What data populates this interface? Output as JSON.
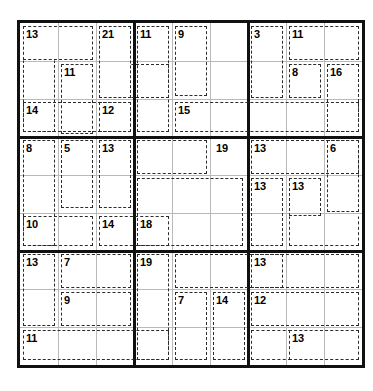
{
  "puzzle": {
    "type": "killer-sudoku",
    "grid_size": 9,
    "box_size": 3,
    "cell_px": 38,
    "colors": {
      "background": "#ffffff",
      "outer_border": "#111111",
      "box_border": "#111111",
      "cell_line": "#b9b9b9",
      "cage_dash": "#2b2b2b",
      "sum_text": "#000000"
    },
    "given_digits": [],
    "cages": [
      {
        "id": "c01",
        "sum": "13",
        "anchor_row": 0,
        "anchor_col": 0,
        "cells": [
          [
            0,
            0
          ],
          [
            0,
            1
          ],
          [
            1,
            0
          ],
          [
            2,
            0
          ]
        ]
      },
      {
        "id": "c02",
        "sum": "21",
        "anchor_row": 0,
        "anchor_col": 2,
        "cells": [
          [
            0,
            2
          ],
          [
            1,
            2
          ],
          [
            1,
            3
          ]
        ]
      },
      {
        "id": "c03",
        "sum": "11",
        "anchor_row": 1,
        "anchor_col": 1,
        "cells": [
          [
            1,
            1
          ],
          [
            2,
            1
          ]
        ]
      },
      {
        "id": "c04",
        "sum": "14",
        "anchor_row": 2,
        "anchor_col": 0,
        "cells": [
          [
            2,
            0
          ],
          [
            2,
            1
          ],
          [
            2,
            2
          ]
        ]
      },
      {
        "id": "c05",
        "sum": "11",
        "anchor_row": 0,
        "anchor_col": 4,
        "cells": [
          [
            0,
            4
          ],
          [
            1,
            4
          ],
          [
            2,
            4
          ]
        ]
      },
      {
        "id": "c06",
        "sum": "9",
        "anchor_row": 0,
        "anchor_col": 5,
        "cells": [
          [
            0,
            5
          ],
          [
            1,
            5
          ]
        ]
      },
      {
        "id": "c07",
        "sum": "12",
        "anchor_row": 2,
        "anchor_col": 3,
        "cells": [
          [
            2,
            3
          ]
        ]
      },
      {
        "id": "c08",
        "sum": "15",
        "anchor_row": 2,
        "anchor_col": 5,
        "cells": [
          [
            2,
            5
          ],
          [
            2,
            6
          ],
          [
            2,
            7
          ],
          [
            2,
            8
          ]
        ]
      },
      {
        "id": "c09",
        "sum": "3",
        "anchor_row": 0,
        "anchor_col": 6,
        "cells": [
          [
            0,
            6
          ],
          [
            1,
            6
          ]
        ]
      },
      {
        "id": "c10",
        "sum": "11",
        "anchor_row": 0,
        "anchor_col": 7,
        "cells": [
          [
            0,
            7
          ],
          [
            0,
            8
          ]
        ]
      },
      {
        "id": "c11",
        "sum": "8",
        "anchor_row": 1,
        "anchor_col": 7,
        "cells": [
          [
            1,
            7
          ]
        ]
      },
      {
        "id": "c12",
        "sum": "16",
        "anchor_row": 1,
        "anchor_col": 8,
        "cells": [
          [
            1,
            8
          ],
          [
            2,
            8
          ]
        ]
      },
      {
        "id": "c13",
        "sum": "8",
        "anchor_row": 3,
        "anchor_col": 0,
        "cells": [
          [
            3,
            0
          ],
          [
            4,
            0
          ],
          [
            5,
            0
          ]
        ]
      },
      {
        "id": "c14",
        "sum": "5",
        "anchor_row": 3,
        "anchor_col": 1,
        "cells": [
          [
            3,
            1
          ],
          [
            4,
            1
          ]
        ]
      },
      {
        "id": "c15",
        "sum": "13",
        "anchor_row": 3,
        "anchor_col": 2,
        "cells": [
          [
            3,
            2
          ],
          [
            4,
            2
          ]
        ]
      },
      {
        "id": "c16",
        "sum": "10",
        "anchor_row": 5,
        "anchor_col": 0,
        "cells": [
          [
            5,
            0
          ],
          [
            5,
            1
          ]
        ]
      },
      {
        "id": "c17",
        "sum": "14",
        "anchor_row": 5,
        "anchor_col": 2,
        "cells": [
          [
            5,
            2
          ],
          [
            5,
            3
          ]
        ]
      },
      {
        "id": "c18",
        "sum": "19",
        "anchor_row": 3,
        "anchor_col": 5,
        "cells": [
          [
            3,
            5
          ],
          [
            3,
            4
          ]
        ]
      },
      {
        "id": "c19",
        "sum": "18",
        "anchor_row": 5,
        "anchor_col": 3,
        "cells": [
          [
            5,
            3
          ],
          [
            5,
            4
          ],
          [
            5,
            5
          ]
        ]
      },
      {
        "id": "c20",
        "sum": "13",
        "anchor_row": 3,
        "anchor_col": 6,
        "cells": [
          [
            3,
            6
          ],
          [
            3,
            7
          ]
        ]
      },
      {
        "id": "c21",
        "sum": "6",
        "anchor_row": 3,
        "anchor_col": 8,
        "cells": [
          [
            3,
            8
          ],
          [
            4,
            8
          ]
        ]
      },
      {
        "id": "c22",
        "sum": "13",
        "anchor_row": 4,
        "anchor_col": 6,
        "cells": [
          [
            4,
            6
          ],
          [
            5,
            6
          ]
        ]
      },
      {
        "id": "c23",
        "sum": "13",
        "anchor_row": 4,
        "anchor_col": 7,
        "cells": [
          [
            4,
            7
          ],
          [
            5,
            7
          ],
          [
            5,
            8
          ]
        ]
      },
      {
        "id": "c24",
        "sum": "13",
        "anchor_row": 6,
        "anchor_col": 0,
        "cells": [
          [
            6,
            0
          ],
          [
            7,
            0
          ]
        ]
      },
      {
        "id": "c25",
        "sum": "7",
        "anchor_row": 6,
        "anchor_col": 1,
        "cells": [
          [
            6,
            1
          ],
          [
            6,
            2
          ]
        ]
      },
      {
        "id": "c26",
        "sum": "9",
        "anchor_row": 7,
        "anchor_col": 1,
        "cells": [
          [
            7,
            1
          ],
          [
            7,
            2
          ]
        ]
      },
      {
        "id": "c27",
        "sum": "11",
        "anchor_row": 8,
        "anchor_col": 0,
        "cells": [
          [
            8,
            0
          ],
          [
            8,
            1
          ],
          [
            8,
            2
          ]
        ]
      },
      {
        "id": "c28",
        "sum": "19",
        "anchor_row": 6,
        "anchor_col": 3,
        "cells": [
          [
            6,
            3
          ],
          [
            7,
            3
          ],
          [
            8,
            3
          ]
        ]
      },
      {
        "id": "c29",
        "sum": "7",
        "anchor_row": 7,
        "anchor_col": 4,
        "cells": [
          [
            7,
            4
          ],
          [
            8,
            4
          ]
        ]
      },
      {
        "id": "c30",
        "sum": "14",
        "anchor_row": 7,
        "anchor_col": 5,
        "cells": [
          [
            7,
            5
          ],
          [
            8,
            5
          ]
        ]
      },
      {
        "id": "c31",
        "sum": "13",
        "anchor_row": 6,
        "anchor_col": 6,
        "cells": [
          [
            6,
            6
          ],
          [
            6,
            7
          ],
          [
            6,
            8
          ]
        ]
      },
      {
        "id": "c32",
        "sum": "12",
        "anchor_row": 7,
        "anchor_col": 6,
        "cells": [
          [
            7,
            6
          ],
          [
            7,
            7
          ],
          [
            7,
            8
          ]
        ]
      },
      {
        "id": "c33",
        "sum": "13",
        "anchor_row": 8,
        "anchor_col": 7,
        "cells": [
          [
            8,
            7
          ],
          [
            8,
            8
          ]
        ]
      }
    ]
  }
}
